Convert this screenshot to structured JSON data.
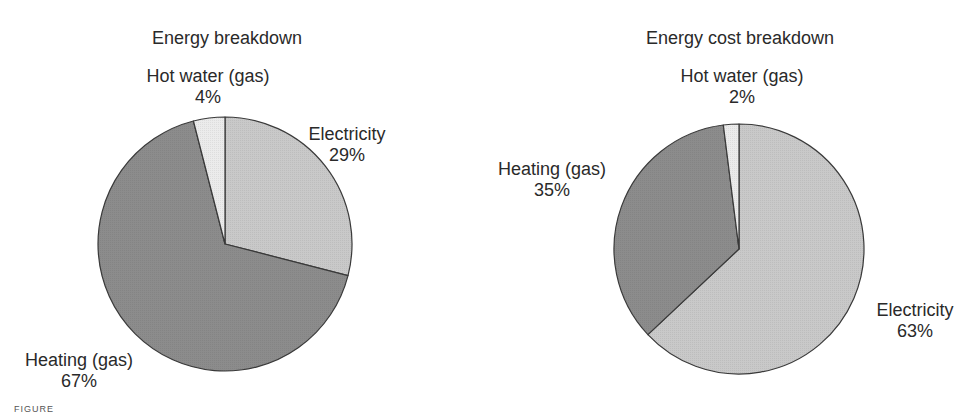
{
  "chart_data": [
    {
      "type": "pie",
      "title": "Energy breakdown",
      "categories": [
        "Electricity",
        "Heating (gas)",
        "Hot water (gas)"
      ],
      "values": [
        29,
        67,
        4
      ],
      "labels": [
        "29%",
        "67%",
        "4%"
      ],
      "colors": [
        "#c9c9c9",
        "#8c8c8c",
        "#ebebeb"
      ],
      "start_angle": "12 o'clock, clockwise",
      "legend": "none (direct labels)"
    },
    {
      "type": "pie",
      "title": "Energy cost breakdown",
      "categories": [
        "Electricity",
        "Heating (gas)",
        "Hot water (gas)"
      ],
      "values": [
        63,
        35,
        2
      ],
      "labels": [
        "63%",
        "35%",
        "2%"
      ],
      "colors": [
        "#c9c9c9",
        "#8c8c8c",
        "#ebebeb"
      ],
      "start_angle": "12 o'clock, clockwise",
      "legend": "none (direct labels)"
    }
  ],
  "charts": {
    "left": {
      "title": "Energy breakdown",
      "hot_water": {
        "name": "Hot water (gas)",
        "pct": "4%"
      },
      "electricity": {
        "name": "Electricity",
        "pct": "29%"
      },
      "heating": {
        "name": "Heating (gas)",
        "pct": "67%"
      }
    },
    "right": {
      "title": "Energy cost breakdown",
      "hot_water": {
        "name": "Hot water (gas)",
        "pct": "2%"
      },
      "electricity": {
        "name": "Electricity",
        "pct": "63%"
      },
      "heating": {
        "name": "Heating (gas)",
        "pct": "35%"
      }
    }
  },
  "caption": "FIGURE"
}
